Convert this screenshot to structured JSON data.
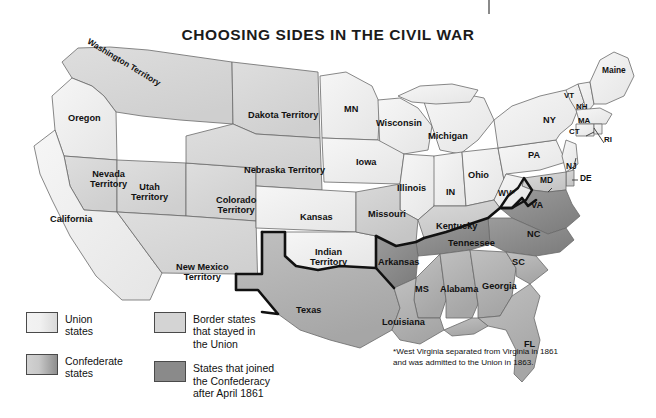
{
  "title": "CHOOSING SIDES IN THE CIVIL WAR",
  "colors": {
    "union": "#f0f0f0",
    "border_state": "#d4d4d4",
    "confederate": "#b5b5b5",
    "confederate_after_april": "#8a8a8a",
    "outline": "#5a5a5a",
    "confederate_boundary": "#101010",
    "water": "#ffffff",
    "text": "#111111"
  },
  "legend": {
    "items": [
      {
        "label": "Union\nstates",
        "label_line1": "Union",
        "label_line2": "states",
        "swatch": "union-swatch"
      },
      {
        "label": "Confederate\nstates",
        "label_line1": "Confederate",
        "label_line2": "states",
        "swatch": "confederate-swatch"
      },
      {
        "label": "Border states that stayed in the Union",
        "label_line1": "Border states",
        "label_line2": "that stayed in",
        "label_line3": "the Union",
        "swatch": "border-states-swatch"
      },
      {
        "label": "States that joined the Confederacy after April 1861",
        "label_line1": "States that joined",
        "label_line2": "the Confederacy",
        "label_line3": "after April 1861",
        "swatch": "joined-after-april-swatch"
      }
    ]
  },
  "footnote": "*West Virginia separated from Virginia in 1861 and was admitted to the Union in 1863.",
  "map_labels": [
    {
      "name": "washington-territory",
      "text": "Washington Territory",
      "x": 82,
      "y": 58,
      "rotate": 31,
      "size": "sm",
      "category": "union"
    },
    {
      "name": "oregon",
      "text": "Oregon",
      "x": 68,
      "y": 114,
      "rotate": 0,
      "size": "",
      "category": "union"
    },
    {
      "name": "california",
      "text": "California",
      "x": 50,
      "y": 215,
      "rotate": 0,
      "size": "",
      "category": "union"
    },
    {
      "name": "nevada-territory",
      "text": "Nevada\nTerritory",
      "line1": "Nevada",
      "line2": "Territory",
      "x": 90,
      "y": 170,
      "rotate": 0,
      "size": "",
      "category": "union"
    },
    {
      "name": "utah-territory",
      "text": "Utah\nTerritory",
      "line1": "Utah",
      "line2": "Territory",
      "x": 131,
      "y": 183,
      "rotate": 0,
      "size": "",
      "category": "union"
    },
    {
      "name": "colorado-territory",
      "text": "Colorado\nTerritory",
      "line1": "Colorado",
      "line2": "Territory",
      "x": 216,
      "y": 196,
      "rotate": 0,
      "size": "",
      "category": "union"
    },
    {
      "name": "new-mexico-territory",
      "text": "New Mexico\nTerritory",
      "line1": "New Mexico",
      "line2": "Territory",
      "x": 176,
      "y": 263,
      "rotate": 0,
      "size": "",
      "category": "union"
    },
    {
      "name": "dakota-territory",
      "text": "Dakota Territory",
      "x": 259,
      "y": 111,
      "rotate": 0,
      "size": "",
      "category": "union"
    },
    {
      "name": "nebraska-territory",
      "text": "Nebraska Territory",
      "x": 258,
      "y": 166,
      "rotate": 0,
      "size": "",
      "category": "union"
    },
    {
      "name": "kansas",
      "text": "Kansas",
      "x": 321,
      "y": 213,
      "rotate": 0,
      "size": "",
      "category": "union"
    },
    {
      "name": "indian-territory",
      "text": "Indian\nTerritory",
      "line1": "Indian",
      "line2": "Territory",
      "x": 330,
      "y": 253,
      "rotate": 0,
      "size": "",
      "category": "union"
    },
    {
      "name": "texas",
      "text": "Texas",
      "x": 312,
      "y": 310,
      "rotate": 0,
      "size": "",
      "category": "confederate"
    },
    {
      "name": "minnesota",
      "text": "MN",
      "x": 353,
      "y": 111,
      "rotate": 0,
      "size": "",
      "category": "union"
    },
    {
      "name": "wisconsin",
      "text": "Wisconsin",
      "x": 400,
      "y": 124,
      "rotate": 0,
      "size": "",
      "category": "union"
    },
    {
      "name": "iowa",
      "text": "Iowa",
      "x": 368,
      "y": 163,
      "rotate": 0,
      "size": "",
      "category": "union"
    },
    {
      "name": "michigan",
      "text": "Michigan",
      "x": 451,
      "y": 137,
      "rotate": 0,
      "size": "",
      "category": "union"
    },
    {
      "name": "illinois",
      "text": "Illinois",
      "x": 412,
      "y": 189,
      "rotate": 0,
      "size": "",
      "category": "union"
    },
    {
      "name": "indiana",
      "text": "IN",
      "x": 452,
      "y": 192,
      "rotate": 0,
      "size": "",
      "category": "union"
    },
    {
      "name": "ohio",
      "text": "Ohio",
      "x": 479,
      "y": 175,
      "rotate": 0,
      "size": "",
      "category": "union"
    },
    {
      "name": "missouri",
      "text": "Missouri",
      "x": 391,
      "y": 215,
      "rotate": 0,
      "size": "",
      "category": "border"
    },
    {
      "name": "kentucky",
      "text": "Kentucky",
      "x": 456,
      "y": 227,
      "rotate": 0,
      "size": "",
      "category": "border"
    },
    {
      "name": "tennessee",
      "text": "Tennessee",
      "x": 473,
      "y": 243,
      "rotate": 0,
      "size": "",
      "category": "joined-after-april"
    },
    {
      "name": "arkansas",
      "text": "Arkansas",
      "x": 398,
      "y": 262,
      "rotate": 0,
      "size": "",
      "category": "joined-after-april"
    },
    {
      "name": "louisiana",
      "text": "Louisiana",
      "x": 404,
      "y": 322,
      "rotate": 0,
      "size": "",
      "category": "confederate"
    },
    {
      "name": "mississippi",
      "text": "MS",
      "x": 421,
      "y": 289,
      "rotate": 0,
      "size": "",
      "category": "confederate"
    },
    {
      "name": "alabama",
      "text": "Alabama",
      "x": 459,
      "y": 288,
      "rotate": 0,
      "size": "",
      "category": "confederate"
    },
    {
      "name": "georgia",
      "text": "Georgia",
      "x": 497,
      "y": 286,
      "rotate": 0,
      "size": "",
      "category": "confederate"
    },
    {
      "name": "florida",
      "text": "FL",
      "x": 529,
      "y": 344,
      "rotate": 0,
      "size": "",
      "category": "confederate"
    },
    {
      "name": "south-carolina",
      "text": "SC",
      "x": 518,
      "y": 262,
      "rotate": 0,
      "size": "",
      "category": "confederate"
    },
    {
      "name": "north-carolina",
      "text": "NC",
      "x": 533,
      "y": 234,
      "rotate": 0,
      "size": "",
      "category": "joined-after-april"
    },
    {
      "name": "virginia",
      "text": "VA",
      "x": 537,
      "y": 205,
      "rotate": 0,
      "size": "",
      "category": "joined-after-april"
    },
    {
      "name": "west-virginia",
      "text": "WV*",
      "x": 505,
      "y": 193,
      "rotate": 0,
      "size": "sm",
      "category": "union"
    },
    {
      "name": "maryland",
      "text": "MD",
      "x": 547,
      "y": 180,
      "rotate": 0,
      "size": "sm",
      "category": "border"
    },
    {
      "name": "delaware",
      "text": "DE",
      "x": 579,
      "y": 178,
      "rotate": 0,
      "size": "sm",
      "category": "border"
    },
    {
      "name": "new-jersey",
      "text": "NJ",
      "x": 570,
      "y": 166,
      "rotate": 0,
      "size": "sm",
      "category": "union"
    },
    {
      "name": "pennsylvania",
      "text": "PA",
      "x": 535,
      "y": 155,
      "rotate": 0,
      "size": "",
      "category": "union"
    },
    {
      "name": "new-york",
      "text": "NY",
      "x": 550,
      "y": 120,
      "rotate": 0,
      "size": "",
      "category": "union"
    },
    {
      "name": "connecticut",
      "text": "CT",
      "x": 573,
      "y": 131,
      "rotate": 0,
      "size": "xs",
      "category": "union"
    },
    {
      "name": "rhode-island",
      "text": "RI",
      "x": 606,
      "y": 139,
      "rotate": 0,
      "size": "xs",
      "category": "union"
    },
    {
      "name": "massachusetts",
      "text": "MA",
      "x": 584,
      "y": 121,
      "rotate": 0,
      "size": "xs",
      "category": "union"
    },
    {
      "name": "new-hampshire",
      "text": "NH",
      "x": 581,
      "y": 106,
      "rotate": 0,
      "size": "xs",
      "category": "union"
    },
    {
      "name": "vermont",
      "text": "VT",
      "x": 568,
      "y": 95,
      "rotate": 0,
      "size": "xs",
      "category": "union"
    },
    {
      "name": "maine",
      "text": "Maine",
      "x": 614,
      "y": 70,
      "rotate": 0,
      "size": "sm",
      "category": "union"
    }
  ]
}
